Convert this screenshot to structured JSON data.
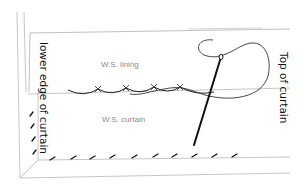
{
  "diagram": {
    "labels": {
      "lower_edge": "lower edge of curtain",
      "top": "Top of curtain",
      "lining": "W.S. lining",
      "curtain": "W.S. curtain"
    },
    "colors": {
      "outline": "#b5b5b5",
      "ink": "#111111",
      "label_gray": "#8a8a8a",
      "background": "#ffffff"
    },
    "stitches": {
      "lining_fold_cross_stitch_count": 4,
      "hem_herringbone_stitch_count": 12
    },
    "elements": [
      "lining outline",
      "curtain outline",
      "folded lining edge with slip stitches",
      "curtain hem with diagonal stitches",
      "needle",
      "thread loop"
    ]
  }
}
